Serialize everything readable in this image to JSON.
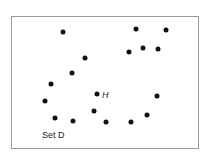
{
  "figure": {
    "set_label": "Set D",
    "point_label": "H",
    "point_label_pos": [
      102,
      95
    ],
    "set_label_pos": [
      42,
      135
    ],
    "points": [
      [
        63,
        32
      ],
      [
        136,
        29
      ],
      [
        166,
        30
      ],
      [
        129,
        52
      ],
      [
        143,
        48
      ],
      [
        158,
        49
      ],
      [
        85,
        58
      ],
      [
        72,
        73
      ],
      [
        51,
        84
      ],
      [
        45,
        101
      ],
      [
        97,
        94
      ],
      [
        157,
        96
      ],
      [
        94,
        111
      ],
      [
        55,
        118
      ],
      [
        73,
        121
      ],
      [
        106,
        122
      ],
      [
        131,
        122
      ],
      [
        147,
        115
      ]
    ]
  }
}
